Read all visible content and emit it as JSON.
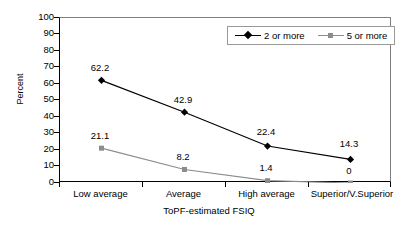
{
  "chart_data": {
    "type": "line",
    "title": "",
    "xlabel": "ToPF-estimated FSIQ",
    "ylabel": "Percent",
    "categories": [
      "Low average",
      "Average",
      "High average",
      "Superior/V.Superior"
    ],
    "series": [
      {
        "name": "2 or more",
        "marker": "diamond",
        "color": "#000000",
        "values": [
          62.2,
          42.9,
          22.4,
          14.3
        ],
        "labels": [
          "62.2",
          "42.9",
          "22.4",
          "14.3"
        ]
      },
      {
        "name": "5 or more",
        "marker": "square",
        "color": "#8c8c8c",
        "values": [
          21.1,
          8.2,
          1.4,
          0
        ],
        "labels": [
          "21.1",
          "8.2",
          "1.4",
          "0"
        ]
      }
    ],
    "ylim": [
      0,
      100
    ],
    "yticks": [
      100,
      90,
      80,
      70,
      60,
      50,
      40,
      30,
      20,
      10,
      0
    ],
    "ytick_labels": [
      "100",
      "90",
      "80",
      "70",
      "60",
      "50",
      "40",
      "30",
      "20",
      "10",
      "0"
    ],
    "grid": false,
    "legend_position": "top-right"
  },
  "legend": {
    "entries": [
      {
        "label": "2 or more"
      },
      {
        "label": "5 or more"
      }
    ]
  }
}
